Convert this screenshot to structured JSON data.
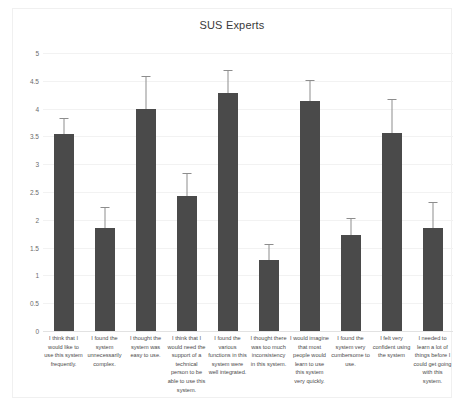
{
  "chart_data": {
    "type": "bar",
    "title": "SUS Experts",
    "xlabel": "",
    "ylabel": "",
    "ylim": [
      0,
      5
    ],
    "ytick_labels": [
      "5",
      "4.5",
      "4",
      "3.5",
      "3",
      "2.5",
      "2",
      "1.5",
      "1",
      "0.5",
      "0"
    ],
    "ytick_values": [
      5,
      4.5,
      4,
      3.5,
      3,
      2.5,
      2,
      1.5,
      1,
      0.5,
      0
    ],
    "grid": true,
    "legend": "none",
    "bar_color": "#4a4a4a",
    "error_bar_color": "#8d8d8d",
    "categories": [
      "I think that I would like to use this system frequently.",
      "I found the system unnecessarily complex.",
      "I thought the system was easy to use.",
      "I think that I would need the support of a technical person to be able to use this system.",
      "I found the various functions in this system were well integrated.",
      "I thought there was too much inconsistency in this system.",
      "I would imagine that most people would learn to use this system very quickly.",
      "I found the system very cumbersome to use.",
      "I felt very confident using the system",
      "I needed to learn a lot of things before I could get going with this system."
    ],
    "values": [
      3.55,
      1.85,
      4.0,
      2.43,
      4.28,
      1.28,
      4.14,
      1.72,
      3.57,
      1.85
    ],
    "errors": [
      0.27,
      0.37,
      0.57,
      0.4,
      0.39,
      0.26,
      0.36,
      0.3,
      0.59,
      0.45
    ]
  }
}
